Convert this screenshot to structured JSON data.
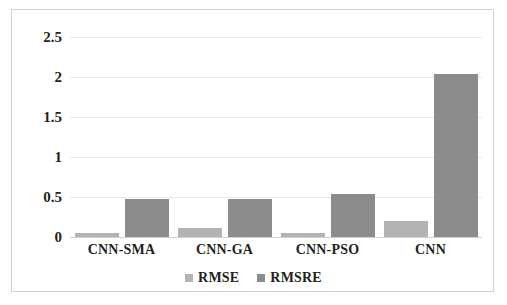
{
  "chart_data": {
    "type": "bar",
    "title": "",
    "subtitle": "",
    "xlabel": "",
    "ylabel": "",
    "categories": [
      "CNN-SMA",
      "CNN-GA",
      "CNN-PSO",
      "CNN"
    ],
    "series": [
      {
        "name": "RMSE",
        "color": "#b3b3b3",
        "values": [
          0.05,
          0.11,
          0.05,
          0.2
        ]
      },
      {
        "name": "RMSRE",
        "color": "#8c8c8c",
        "values": [
          0.47,
          0.48,
          0.54,
          2.04
        ]
      }
    ],
    "ylim": [
      0,
      2.5
    ],
    "yticks": [
      "0",
      "0.5",
      "1",
      "1.5",
      "2",
      "2.5"
    ],
    "ytick_values": [
      0,
      0.5,
      1,
      1.5,
      2,
      2.5
    ],
    "grid": "horizontal",
    "legend_position": "bottom",
    "annotations": []
  },
  "axis": {
    "y": {
      "ticks": [
        {
          "label": "2.5",
          "value": 2.5
        },
        {
          "label": "2",
          "value": 2
        },
        {
          "label": "1.5",
          "value": 1.5
        },
        {
          "label": "1",
          "value": 1
        },
        {
          "label": "0.5",
          "value": 0.5
        },
        {
          "label": "0",
          "value": 0
        }
      ]
    },
    "x": {
      "ticks": [
        {
          "label": "CNN-SMA"
        },
        {
          "label": "CNN-GA"
        },
        {
          "label": "CNN-PSO"
        },
        {
          "label": "CNN"
        }
      ]
    }
  },
  "legend": {
    "items": [
      {
        "label": "RMSE",
        "color": "#b3b3b3"
      },
      {
        "label": "RMSRE",
        "color": "#8c8c8c"
      }
    ]
  }
}
